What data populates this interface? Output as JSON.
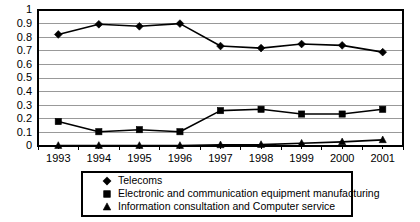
{
  "chart_data": {
    "type": "line",
    "title": "",
    "subtitle": "",
    "xlabel": "",
    "ylabel": "",
    "categories": [
      "1993",
      "1994",
      "1995",
      "1996",
      "1997",
      "1998",
      "1999",
      "2000",
      "2001"
    ],
    "xlim": [
      "1993",
      "2001"
    ],
    "ylim": [
      0,
      1
    ],
    "ytick_labels": [
      "1",
      "0.9",
      "0.8",
      "0.7",
      "0.6",
      "0.5",
      "0.4",
      "0.3",
      "0.2",
      "0.1",
      "0"
    ],
    "ytick_values": [
      1,
      0.9,
      0.8,
      0.7,
      0.6,
      0.5,
      0.4,
      0.3,
      0.2,
      0.1,
      0
    ],
    "grid": "horizontal",
    "legend_position": "bottom",
    "series": [
      {
        "name": "Telecoms",
        "marker": "diamond",
        "color": "#000000",
        "values": [
          0.82,
          0.895,
          0.88,
          0.9,
          0.735,
          0.72,
          0.75,
          0.74,
          0.69
        ]
      },
      {
        "name": "Electronic and communication equipment manufacturing",
        "marker": "square",
        "color": "#000000",
        "values": [
          0.18,
          0.105,
          0.12,
          0.105,
          0.26,
          0.27,
          0.235,
          0.235,
          0.27
        ]
      },
      {
        "name": "Information consultation and Computer service",
        "marker": "triangle",
        "color": "#000000",
        "values": [
          0.003,
          0.003,
          0.003,
          0.003,
          0.008,
          0.01,
          0.02,
          0.03,
          0.045
        ]
      }
    ]
  },
  "legend": {
    "items": [
      {
        "label": "Telecoms",
        "marker": "diamond"
      },
      {
        "label": "Electronic and communication equipment manufacturing",
        "marker": "square"
      },
      {
        "label": "Information consultation and Computer service",
        "marker": "triangle"
      }
    ]
  },
  "colors": {
    "ink": "#000000",
    "grid": "#808080",
    "background": "#ffffff"
  }
}
